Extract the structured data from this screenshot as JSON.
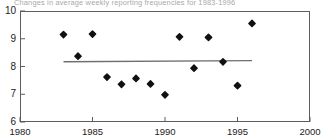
{
  "chart_data": {
    "type": "scatter",
    "title": "Changes in average weekly reporting frequencies for 1983-1996",
    "xlabel": "",
    "ylabel": "",
    "xlim": [
      1980,
      2000
    ],
    "ylim": [
      6,
      10
    ],
    "xticks": [
      1980,
      1985,
      1990,
      1995,
      2000
    ],
    "xtick_labels": [
      "1980",
      "1985",
      "1990",
      "1995",
      "2000"
    ],
    "yticks": [
      6,
      7,
      8,
      9,
      10
    ],
    "ytick_labels": [
      "6",
      "7",
      "8",
      "9",
      "10"
    ],
    "grid": false,
    "legend": null,
    "marker": "diamond",
    "marker_color": "#111111",
    "frame_color": "#5d5d5d",
    "series": [
      {
        "name": "Average weekly reporting frequency",
        "x": [
          1983,
          1984,
          1985,
          1986,
          1987,
          1988,
          1989,
          1990,
          1991,
          1992,
          1993,
          1994,
          1995,
          1996
        ],
        "y": [
          9.15,
          8.37,
          9.17,
          7.62,
          7.36,
          7.57,
          7.37,
          6.98,
          9.07,
          7.94,
          9.05,
          8.17,
          7.31,
          9.55
        ]
      }
    ],
    "trend_line": {
      "name": "Mean / trend line",
      "x_start": 1983,
      "x_end": 1996,
      "y_start": 8.17,
      "y_end": 8.21,
      "color": "#6f6f6f",
      "width": 1.4
    }
  }
}
